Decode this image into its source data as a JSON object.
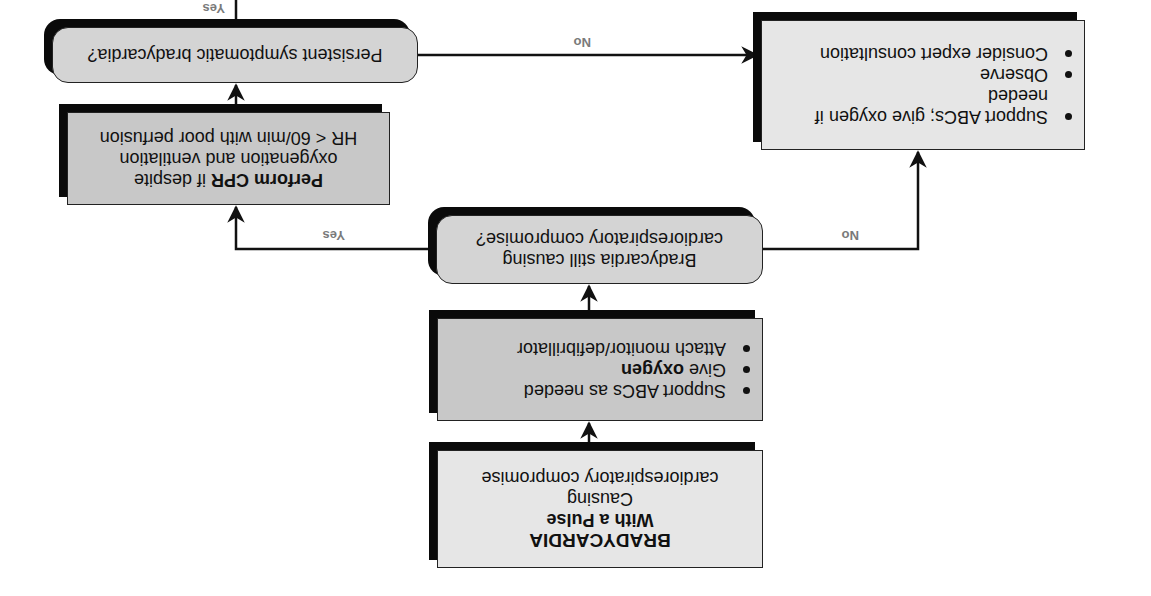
{
  "title_box": {
    "line1": "BRADYCARDIA",
    "line2": "With a Pulse",
    "line3": "Causing",
    "line4": "cardiorespiratory compromise"
  },
  "initial_actions": {
    "items": [
      {
        "text": "Support ABCs as needed",
        "bold": ""
      },
      {
        "prefix": "Give ",
        "bold": "oxygen"
      },
      {
        "text": "Attach monitor/defibrillator",
        "bold": ""
      }
    ]
  },
  "decision_1": {
    "line1": "Bradycardia still causing",
    "line2": "cardiorespiratory compromise?"
  },
  "cpr_box": {
    "bold": "Perform CPR",
    "line1_rest": " if despite",
    "line2": "oxygenation and ventilation",
    "line3": "HR < 60/min with poor perfusion"
  },
  "decision_2": {
    "text": "Persistent symptomatic bradycardia?"
  },
  "no_path_box": {
    "items": [
      {
        "text": "Support ABCs; give oxygen if needed"
      },
      {
        "text": "Observe"
      },
      {
        "text": "Consider expert consultation"
      }
    ]
  },
  "edge_labels": {
    "d1_yes": "Yes",
    "d1_no": "No",
    "d2_no": "No",
    "d2_yes": "Yes"
  },
  "colors": {
    "box_fill": "#c8c8c8",
    "box_fill_light": "#e6e6e6",
    "decision_fill": "#d4d4d4",
    "shadow": "#0a0a0a",
    "line": "#111111",
    "label": "#7a7a7a"
  }
}
